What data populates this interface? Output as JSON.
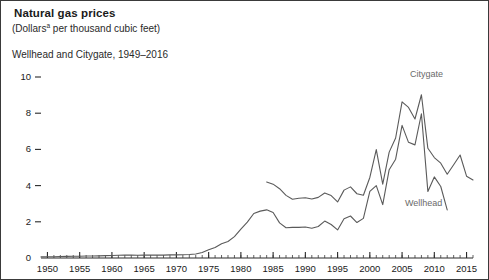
{
  "figure": {
    "title": "Natural gas prices",
    "subtitle_prefix": "(Dollars",
    "subtitle_superscript": "a",
    "subtitle_suffix": " per thousand cubic feet)",
    "scope": "Wellhead and Citygate, 1949–2016",
    "border_color": "#3a3a3a",
    "background": "#ffffff"
  },
  "chart_data": {
    "type": "line",
    "title": "Natural gas prices",
    "subtitle": "(Dollarsᵃ per thousand cubic feet)",
    "xlabel": "",
    "ylabel": "",
    "ylim": [
      0,
      10
    ],
    "xlim": [
      1949,
      2016
    ],
    "grid": false,
    "legend_position": "inline-labels",
    "y_ticks": [
      0,
      2,
      4,
      6,
      8,
      10
    ],
    "y_tick_labels": [
      "0",
      "2",
      "4",
      "6",
      "8",
      "10"
    ],
    "x_ticks": [
      1950,
      1955,
      1960,
      1965,
      1970,
      1975,
      1980,
      1985,
      1990,
      1995,
      2000,
      2005,
      2010,
      2015
    ],
    "x_tick_labels": [
      "1950",
      "1955",
      "1960",
      "1965",
      "1970",
      "1975",
      "1980",
      "1985",
      "1990",
      "1995",
      "2000",
      "2005",
      "2010",
      "2015"
    ],
    "x_minor_tick_interval": 1,
    "line_color": "#5a5a5a",
    "series": [
      {
        "name": "Wellhead",
        "label": "Wellhead",
        "color": "#5a5a5a",
        "x": [
          1949,
          1950,
          1951,
          1952,
          1953,
          1954,
          1955,
          1956,
          1957,
          1958,
          1959,
          1960,
          1961,
          1962,
          1963,
          1964,
          1965,
          1966,
          1967,
          1968,
          1969,
          1970,
          1971,
          1972,
          1973,
          1974,
          1975,
          1976,
          1977,
          1978,
          1979,
          1980,
          1981,
          1982,
          1983,
          1984,
          1985,
          1986,
          1987,
          1988,
          1989,
          1990,
          1991,
          1992,
          1993,
          1994,
          1995,
          1996,
          1997,
          1998,
          1999,
          2000,
          2001,
          2002,
          2003,
          2004,
          2005,
          2006,
          2007,
          2008,
          2009,
          2010,
          2011,
          2012
        ],
        "values": [
          0.06,
          0.07,
          0.07,
          0.08,
          0.09,
          0.1,
          0.1,
          0.11,
          0.11,
          0.12,
          0.13,
          0.14,
          0.15,
          0.16,
          0.16,
          0.15,
          0.16,
          0.16,
          0.16,
          0.16,
          0.17,
          0.17,
          0.18,
          0.19,
          0.22,
          0.3,
          0.45,
          0.58,
          0.79,
          0.91,
          1.18,
          1.59,
          1.98,
          2.46,
          2.59,
          2.66,
          2.51,
          1.94,
          1.67,
          1.69,
          1.69,
          1.71,
          1.64,
          1.74,
          2.04,
          1.85,
          1.55,
          2.17,
          2.32,
          1.96,
          2.19,
          3.68,
          4.0,
          2.95,
          4.88,
          5.46,
          7.33,
          6.39,
          6.25,
          7.97,
          3.67,
          4.48,
          3.95,
          2.66
        ],
        "label_at_x": 2009
      },
      {
        "name": "Citygate",
        "label": "Citygate",
        "color": "#5a5a5a",
        "x": [
          1984,
          1985,
          1986,
          1987,
          1988,
          1989,
          1990,
          1991,
          1992,
          1993,
          1994,
          1995,
          1996,
          1997,
          1998,
          1999,
          2000,
          2001,
          2002,
          2003,
          2004,
          2005,
          2006,
          2007,
          2008,
          2009,
          2010,
          2011,
          2012,
          2013,
          2014,
          2015,
          2016
        ],
        "values": [
          4.2,
          4.08,
          3.83,
          3.46,
          3.25,
          3.3,
          3.33,
          3.26,
          3.35,
          3.59,
          3.45,
          3.1,
          3.75,
          3.93,
          3.55,
          3.47,
          4.45,
          5.99,
          4.08,
          5.85,
          6.63,
          8.63,
          8.32,
          7.68,
          9.02,
          6.06,
          5.55,
          5.24,
          4.63,
          5.15,
          5.69,
          4.52,
          4.31
        ],
        "label_at_x": 2008
      }
    ]
  },
  "series_labels": {
    "citygate": "Citygate",
    "wellhead": "Wellhead"
  }
}
